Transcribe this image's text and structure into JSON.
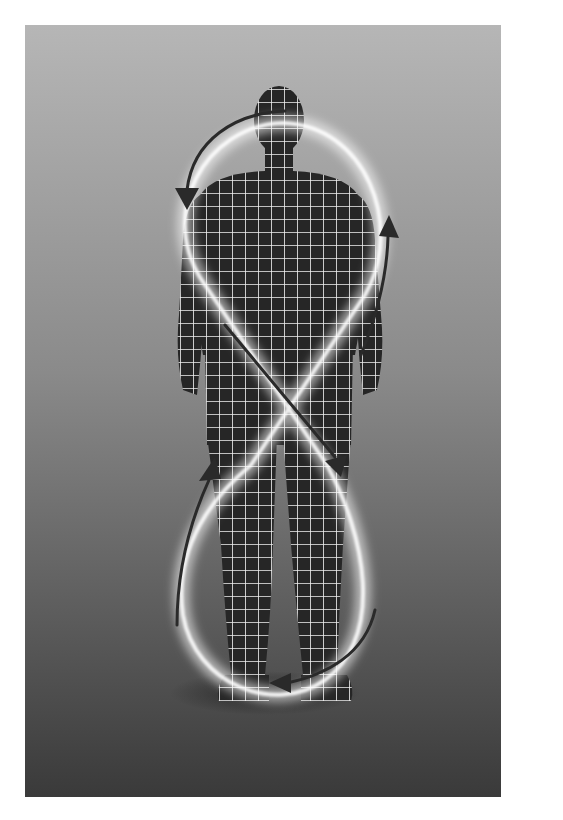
{
  "illustration": {
    "title": "Human figure with figure-eight energy loop",
    "subject": "grid-patterned human silhouette",
    "motif": "glowing figure-eight (infinity) loop with directional arrows",
    "colors": {
      "background_top": "#b4b4b4",
      "background_bottom": "#3c3c3c",
      "figure_fill": "#262626",
      "grid_lines": "#ffffff",
      "glow": "#ffffff",
      "arrows": "#2a2a2a",
      "page": "#ffffff"
    },
    "arrows": [
      {
        "name": "arrow-top-left-down",
        "direction": "counterclockwise"
      },
      {
        "name": "arrow-right-up",
        "direction": "up"
      },
      {
        "name": "arrow-center-diagonal-down",
        "direction": "down-right"
      },
      {
        "name": "arrow-lower-left-up",
        "direction": "up-right"
      },
      {
        "name": "arrow-bottom-left",
        "direction": "left"
      }
    ]
  }
}
